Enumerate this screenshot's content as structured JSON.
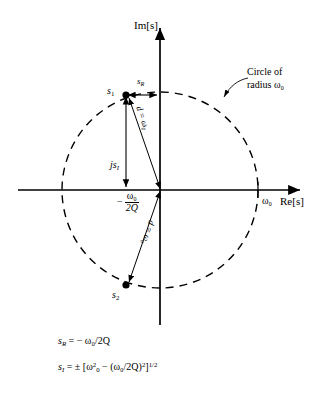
{
  "figure": {
    "title_alt": "s-plane pole locations for a second-order resonant system",
    "axes": {
      "imaginary_axis_label": "Im[s]",
      "real_axis_label": "Re[s]",
      "real_axis_tick_label": "ω₀"
    },
    "annotations": {
      "pole_1_label": "s",
      "pole_1_sub": "1",
      "pole_2_label": "s",
      "pole_2_sub": "2",
      "real_part_label": "s",
      "real_part_sub": "R",
      "imag_part_label": "js",
      "imag_part_sub": "I",
      "distance_label_upper": "d = ω₀",
      "distance_label_lower": "d = ω₀",
      "real_coordinate_minus": "−",
      "real_coordinate_numerator": "ω₀",
      "real_coordinate_denominator": "2Q",
      "circle_note_line1": "Circle of",
      "circle_note_line2": "radius ω₀"
    },
    "equations": {
      "eq1": {
        "lhs": "s",
        "lhs_sub": "R",
        "rhs": "= − ω₀/2Q"
      },
      "eq2": {
        "lhs": "s",
        "lhs_sub": "I",
        "rhs_prefix": "= ± [ω",
        "rhs_sup1": "2",
        "rhs_sub1": "0",
        "rhs_mid": " − (ω₀/2Q)",
        "rhs_sup2": "2",
        "rhs_suffix": "]",
        "rhs_sup3": "1/2"
      }
    },
    "geometry": {
      "origin_x": 160,
      "origin_y": 190,
      "circle_radius": 98,
      "pole_1_x": 126,
      "pole_1_y": 95,
      "pole_2_x": 126,
      "pole_2_y": 285
    },
    "colors": {
      "stroke": "#000000",
      "background": "#ffffff"
    }
  }
}
